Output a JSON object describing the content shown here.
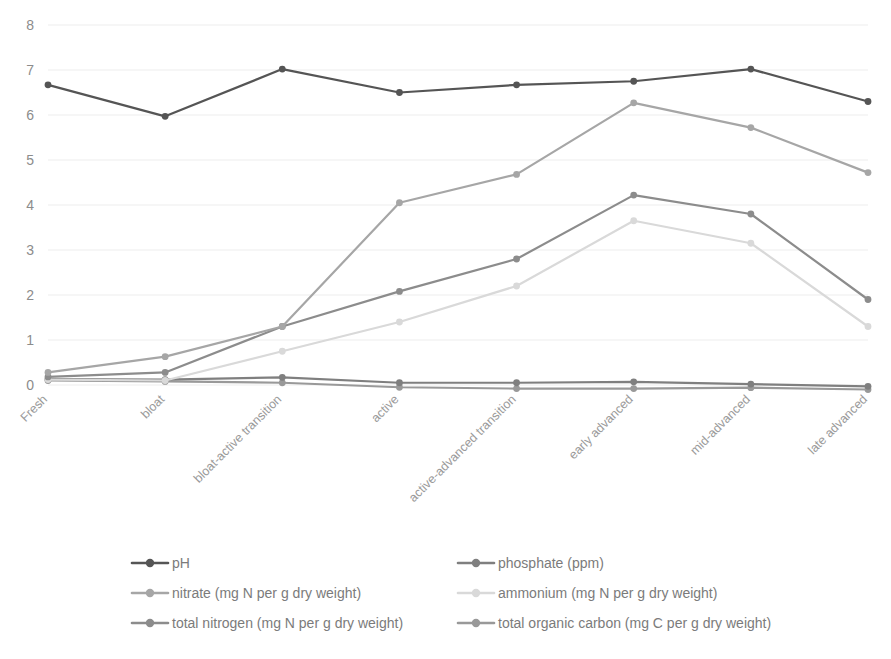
{
  "chart_data": {
    "type": "line",
    "title": "",
    "xlabel": "",
    "ylabel": "",
    "ylim": [
      0,
      8
    ],
    "yticks": [
      0,
      1,
      2,
      3,
      4,
      5,
      6,
      7,
      8
    ],
    "grid": true,
    "legend_position": "bottom",
    "categories": [
      "Fresh",
      "bloat",
      "bloat-active transition",
      "active",
      "active-advanced transition",
      "early advanced",
      "mid-advanced",
      "late advanced"
    ],
    "series": [
      {
        "name": "pH",
        "color": "#555555",
        "values": [
          6.67,
          5.97,
          7.02,
          6.5,
          6.67,
          6.75,
          7.02,
          6.3
        ]
      },
      {
        "name": "phosphate (ppm)",
        "color": "#7f7f7f",
        "values": [
          0.13,
          0.12,
          0.17,
          0.05,
          0.05,
          0.07,
          0.02,
          -0.03
        ]
      },
      {
        "name": "nitrate (mg N per g dry weight)",
        "color": "#a6a6a6",
        "values": [
          0.28,
          0.63,
          1.3,
          4.05,
          4.68,
          6.27,
          5.72,
          4.72
        ]
      },
      {
        "name": "ammonium (mg N per g dry weight)",
        "color": "#d9d9d9",
        "values": [
          0.12,
          0.1,
          0.75,
          1.4,
          2.2,
          3.65,
          3.15,
          1.3
        ]
      },
      {
        "name": "total nitrogen (mg N per g dry weight)",
        "color": "#8c8c8c",
        "values": [
          0.18,
          0.28,
          1.3,
          2.08,
          2.8,
          4.22,
          3.8,
          1.9
        ]
      },
      {
        "name": "total organic carbon (mg C per g dry weight)",
        "color": "#999999",
        "values": [
          0.1,
          0.08,
          0.05,
          -0.05,
          -0.08,
          -0.08,
          -0.06,
          -0.1
        ]
      }
    ]
  },
  "legend": {
    "entries": [
      {
        "label": "pH",
        "color": "#555555"
      },
      {
        "label": "phosphate (ppm)",
        "color": "#7f7f7f"
      },
      {
        "label": "nitrate (mg N per g dry weight)",
        "color": "#a6a6a6"
      },
      {
        "label": "ammonium (mg N per g dry weight)",
        "color": "#d9d9d9"
      },
      {
        "label": "total nitrogen (mg N per g dry weight)",
        "color": "#8c8c8c"
      },
      {
        "label": "total organic carbon (mg C per g dry weight)",
        "color": "#999999"
      }
    ]
  }
}
